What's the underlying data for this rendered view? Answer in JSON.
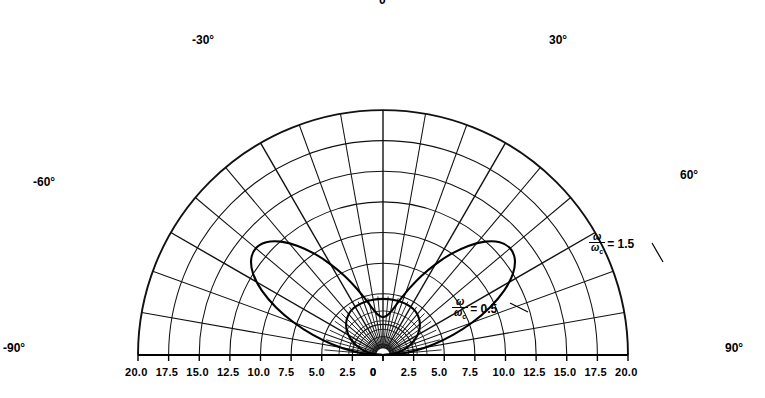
{
  "chart_data": {
    "type": "line",
    "title": "",
    "subtitle": "",
    "projection": "polar-half-plane",
    "xlabel": "",
    "ylabel": "",
    "angular_axis": {
      "label": "",
      "unit": "degrees",
      "range": [
        -90,
        90
      ],
      "gridline_step": 10,
      "tick_labels": [
        {
          "value": -90,
          "text": "-90°"
        },
        {
          "value": -60,
          "text": "-60°"
        },
        {
          "value": -30,
          "text": "-30°"
        },
        {
          "value": 0,
          "text": "0"
        },
        {
          "value": 30,
          "text": "30°"
        },
        {
          "value": 60,
          "text": "60°"
        },
        {
          "value": 90,
          "text": "90°"
        }
      ]
    },
    "radial_axis": {
      "label": "",
      "range": [
        0,
        20
      ],
      "tick_step": 2.5,
      "grid": true,
      "left_tick_labels": [
        "20.0",
        "17.5",
        "15.0",
        "12.5",
        "10.0",
        "7.5",
        "5.0",
        "2.5",
        "0"
      ],
      "right_tick_labels": [
        "0",
        "2.5",
        "5.0",
        "7.5",
        "10.0",
        "12.5",
        "15.0",
        "17.5",
        "20.0"
      ]
    },
    "legend": {
      "position": "inline-annotations"
    },
    "series": [
      {
        "name": "ω/ωc = 0.5",
        "label_numerator": "ω",
        "label_denominator": "ω",
        "label_denominator_sub": "c",
        "label_value": "= 0.5",
        "color": "#000000",
        "angles_deg": [
          -90,
          -85,
          -80,
          -75,
          -70,
          -65,
          -60,
          -55,
          -50,
          -45,
          -40,
          -35,
          -30,
          -25,
          -20,
          -15,
          -10,
          -5,
          0,
          5,
          10,
          15,
          20,
          25,
          30,
          35,
          40,
          45,
          50,
          55,
          60,
          65,
          70,
          75,
          80,
          85,
          90
        ],
        "values": [
          0.0,
          0.62,
          1.22,
          1.79,
          2.33,
          2.82,
          3.25,
          3.62,
          3.93,
          4.17,
          4.35,
          4.47,
          4.53,
          4.56,
          4.57,
          4.58,
          4.58,
          4.58,
          4.58,
          4.58,
          4.58,
          4.58,
          4.57,
          4.56,
          4.53,
          4.47,
          4.35,
          4.17,
          3.93,
          3.62,
          3.25,
          2.82,
          2.33,
          1.79,
          1.22,
          0.62,
          0.0
        ]
      },
      {
        "name": "ω/ωc = 1.5",
        "label_numerator": "ω",
        "label_denominator": "ω",
        "label_denominator_sub": "c",
        "label_value": "= 1.5",
        "color": "#000000",
        "angles_deg": [
          -90,
          -86,
          -82,
          -78,
          -74,
          -70,
          -66,
          -62,
          -58,
          -54,
          -50,
          -46,
          -42,
          -38,
          -34,
          -30,
          -26,
          -22,
          -18,
          -14,
          -10,
          -6,
          -2,
          2,
          6,
          10,
          14,
          18,
          22,
          26,
          30,
          34,
          38,
          42,
          46,
          50,
          54,
          58,
          62,
          66,
          70,
          74,
          78,
          82,
          86,
          90
        ],
        "values": [
          0.0,
          1.3,
          2.7,
          4.25,
          5.95,
          7.75,
          9.55,
          11.2,
          12.5,
          13.3,
          13.55,
          13.25,
          12.45,
          11.3,
          9.95,
          8.55,
          7.2,
          5.95,
          4.9,
          4.1,
          3.55,
          3.25,
          3.12,
          3.12,
          3.25,
          3.55,
          4.1,
          4.9,
          5.95,
          7.2,
          8.55,
          9.95,
          11.3,
          12.45,
          13.25,
          13.55,
          13.3,
          12.5,
          11.2,
          9.55,
          7.75,
          5.95,
          4.25,
          2.7,
          1.3,
          0.0
        ]
      }
    ],
    "annotations": [
      {
        "text": "ω/ωc = 1.5",
        "x_units": 9.0,
        "y_units": 3.6
      },
      {
        "text": "ω/ωc = 0.5",
        "x_units": 3.0,
        "y_units": 1.9
      }
    ]
  },
  "angle_labels": {
    "neg90": "-90°",
    "neg60": "-60°",
    "neg30": "-30°",
    "zero": "0",
    "pos30": "30°",
    "pos60": "60°",
    "pos90": "90°"
  },
  "left_axis": {
    "t0": "20.0",
    "t1": "17.5",
    "t2": "15.0",
    "t3": "12.5",
    "t4": "10.0",
    "t5": "7.5",
    "t6": "5.0",
    "t7": "2.5",
    "t8": "0"
  },
  "right_axis": {
    "t0": "0",
    "t1": "2.5",
    "t2": "5.0",
    "t3": "7.5",
    "t4": "10.0",
    "t5": "12.5",
    "t6": "15.0",
    "t7": "17.5",
    "t8": "20.0"
  },
  "curve_labels": {
    "outer": {
      "num": "ω",
      "den": "ω",
      "sub": "c",
      "eq": "= 1.5"
    },
    "inner": {
      "num": "ω",
      "den": "ω",
      "sub": "c",
      "eq": "= 0.5"
    }
  },
  "colors": {
    "ink": "#000000",
    "grid": "#111111",
    "background": "#ffffff"
  }
}
